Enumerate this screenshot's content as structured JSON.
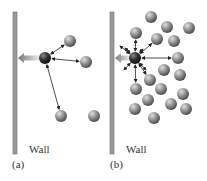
{
  "panels": [
    {
      "id": "a",
      "caption": "(a)",
      "wall_label": "Wall",
      "wall": {
        "x": 13,
        "y": 12,
        "w": 4,
        "h": 142
      },
      "focus": {
        "cx": 45,
        "cy": 58,
        "r": 6
      },
      "molecules": [
        {
          "cx": 70,
          "cy": 41
        },
        {
          "cx": 86,
          "cy": 62
        },
        {
          "cx": 61,
          "cy": 116
        },
        {
          "cx": 94,
          "cy": 116
        }
      ],
      "arrows_to": [
        0,
        1,
        2
      ]
    },
    {
      "id": "b",
      "caption": "(b)",
      "wall_label": "Wall",
      "wall": {
        "x": 110,
        "y": 12,
        "w": 4,
        "h": 142
      },
      "focus": {
        "cx": 135,
        "cy": 58,
        "r": 6
      },
      "molecules": [
        {
          "cx": 151,
          "cy": 17
        },
        {
          "cx": 167,
          "cy": 27
        },
        {
          "cx": 189,
          "cy": 28
        },
        {
          "cx": 136,
          "cy": 33
        },
        {
          "cx": 157,
          "cy": 39
        },
        {
          "cx": 174,
          "cy": 41
        },
        {
          "cx": 178,
          "cy": 58
        },
        {
          "cx": 164,
          "cy": 70
        },
        {
          "cx": 180,
          "cy": 75
        },
        {
          "cx": 150,
          "cy": 80
        },
        {
          "cx": 136,
          "cy": 89
        },
        {
          "cx": 161,
          "cy": 89
        },
        {
          "cx": 183,
          "cy": 94
        },
        {
          "cx": 148,
          "cy": 100
        },
        {
          "cx": 171,
          "cy": 104
        },
        {
          "cx": 135,
          "cy": 109
        },
        {
          "cx": 186,
          "cy": 109
        },
        {
          "cx": 154,
          "cy": 118
        }
      ],
      "arrows_to": [
        3,
        4,
        6,
        9,
        10
      ],
      "extra_short_arrows": [
        [
          120,
          46
        ],
        [
          124,
          70
        ],
        [
          146,
          70
        ],
        [
          125,
          48
        ],
        [
          143,
          49
        ]
      ]
    }
  ],
  "colors": {
    "wall": "#9a9a9a",
    "wall_edge": "#6e6e6e",
    "molecule": "#8c8c8c",
    "focus": "#333333",
    "arrow": "#222222",
    "push_arrow": "#888888"
  }
}
